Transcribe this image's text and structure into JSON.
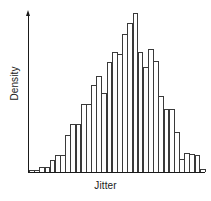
{
  "chart_data": {
    "type": "bar",
    "title": "",
    "subtitle": "",
    "xlabel": "Jitter",
    "ylabel": "Density",
    "grid": false,
    "legend": null,
    "axis_style": "y-axis arrow, x-axis baseline, no tick labels",
    "bar_style": "white fill, dark outline, adjacent bins (histogram)",
    "n_bins": 32,
    "ylim": [
      0,
      1
    ],
    "values": [
      0.012,
      0.012,
      0.03,
      0.03,
      0.075,
      0.11,
      0.11,
      0.23,
      0.3,
      0.3,
      0.43,
      0.43,
      0.545,
      0.605,
      0.5,
      0.69,
      0.755,
      0.74,
      0.87,
      0.94,
      1.0,
      0.755,
      0.66,
      0.775,
      0.7,
      0.48,
      0.395,
      0.395,
      0.25,
      0.085,
      0.12,
      0.115,
      0.105,
      0.02
    ]
  },
  "labels": {
    "ylabel": "Density",
    "xlabel": "Jitter"
  },
  "colors": {
    "bar_outline": "#3a3a3a",
    "bar_fill": "#ffffff",
    "axis": "#1a1a1a",
    "background": "#ffffff"
  }
}
